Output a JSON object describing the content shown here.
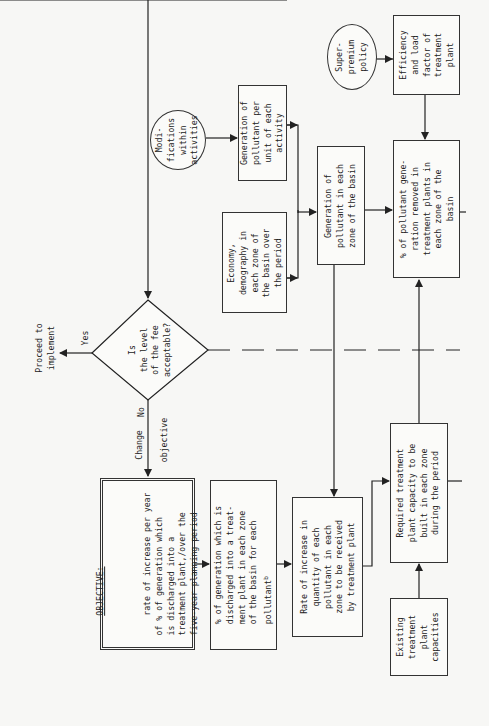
{
  "decision": {
    "question": "Is\nthe level\nof the fee\nacceptable?",
    "yes_label": "Yes",
    "no_label": "No",
    "proceed_label": "Proceed to\nimplement",
    "change_label": "Change",
    "objective_label": "objective"
  },
  "objective_box": {
    "heading": "OBJECTIVE:",
    "text": "rate of increase per year\nof % of generation which\nis discharged into a\ntreatment plant,/over the\nfive-year planning period"
  },
  "boxes": {
    "pct_generation_discharged": "% of generation which is\ndischarged into a treat-\nment plant in each zone\nof the basin for each\npollutant",
    "pct_generation_discharged_footnote": "b",
    "rate_increase_quantity": "Rate of increase in\nquantity of each\npollutant in each\nzone to be received\nby treatment plant",
    "required_capacity": "Required treatment\nplant capacity to be\nbuilt in each zone\nduring the period",
    "existing_capacities": "Existing\ntreatment\nplant\ncapacities",
    "generation_per_unit": "Generation of\npollutant per\nunit of each\nactivity",
    "economy_demography": "Economy,\ndemography in\neach zone of\nthe basin over\nthe period",
    "generation_each_zone": "Generation of\npollutant in each\nzone of the basin",
    "pct_removed": "% of pollutant gene-\nration removed in\ntreatment plants in\neach zone of the\nbasin",
    "efficiency_load": "Efficiency\nand load\nfactor of\ntreatment\nplant"
  },
  "circles": {
    "modifications": "Modi-\nfications\nwithin\nactivities",
    "super_premium": "Super-\npremium\npolicy"
  }
}
